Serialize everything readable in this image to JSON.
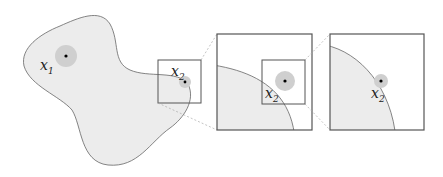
{
  "labels": {
    "point1": "x",
    "point1_sub": "1",
    "point2": "x",
    "point2_sub": "2"
  },
  "colors": {
    "region_fill": "#ececec",
    "region_stroke": "#666666",
    "halo": "#cfcfcf",
    "box_stroke": "#555555",
    "connector": "#aaaaaa"
  },
  "panels": [
    {
      "name": "domain",
      "description": "blob region with points x1 and x2"
    },
    {
      "name": "zoom-1",
      "description": "magnified view near x2"
    },
    {
      "name": "zoom-2",
      "description": "further magnified view near x2"
    }
  ]
}
